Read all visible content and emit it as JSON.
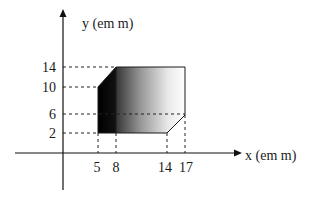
{
  "diagram": {
    "y_axis_label": "y (em m)",
    "x_axis_label": "x (em m)",
    "y_ticks": [
      "14",
      "10",
      "6",
      "2"
    ],
    "x_ticks": [
      "5",
      "8",
      "14",
      "17"
    ],
    "shape": {
      "description": "polygonal plate with gradient fill (black at left to white at right)",
      "vertices": [
        [
          5,
          10
        ],
        [
          8,
          14
        ],
        [
          17,
          14
        ],
        [
          17,
          6
        ],
        [
          14,
          2
        ],
        [
          5,
          2
        ]
      ],
      "colors": {
        "dark": "#000000",
        "light": "#ffffff",
        "outline": "#1a1a1a"
      }
    }
  }
}
